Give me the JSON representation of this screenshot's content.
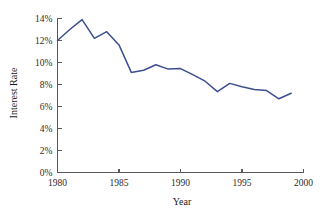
{
  "chart_data": {
    "type": "line",
    "title": "",
    "xlabel": "Year",
    "ylabel": "Interest Rate",
    "xlim": [
      1980,
      2000
    ],
    "ylim": [
      0,
      14
    ],
    "grid": false,
    "legend": false,
    "x_ticks": [
      1980,
      1985,
      1990,
      1995,
      2000
    ],
    "x_tick_labels": [
      "1980",
      "1985",
      "1990",
      "1995",
      "2000"
    ],
    "y_ticks": [
      0,
      2,
      4,
      6,
      8,
      10,
      12,
      14
    ],
    "y_tick_labels": [
      "0%",
      "2%",
      "4%",
      "6%",
      "8%",
      "10%",
      "12%",
      "14%"
    ],
    "series": [
      {
        "name": "Interest Rate",
        "color": "#3d4e8f",
        "x": [
          1980,
          1981,
          1982,
          1983,
          1984,
          1985,
          1986,
          1987,
          1988,
          1989,
          1990,
          1991,
          1992,
          1993,
          1994,
          1995,
          1996,
          1997,
          1998,
          1999
        ],
        "values": [
          12.0,
          13.0,
          13.9,
          12.2,
          12.8,
          11.6,
          9.1,
          9.3,
          9.8,
          9.4,
          9.45,
          8.9,
          8.3,
          7.35,
          8.1,
          7.8,
          7.55,
          7.45,
          6.7,
          7.2
        ]
      }
    ]
  },
  "colors": {
    "line": "#3d4e8f",
    "axis": "#5a5a5a",
    "text": "#1a1a1a",
    "background": "#ffffff"
  },
  "labels": {
    "x_axis_title": "Year",
    "y_axis_title": "Interest Rate"
  }
}
